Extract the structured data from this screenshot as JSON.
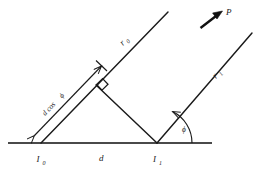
{
  "figure": {
    "background_color": "#ffffff",
    "line_color": "#1a1a1a",
    "text_color": "#1a1a1a",
    "labels": {
      "source_left": "I",
      "source_left_sub": "0",
      "source_right": "I",
      "source_right_sub": "1",
      "ray_left": "r",
      "ray_left_sub": "0",
      "ray_right": "r",
      "ray_right_sub": "1",
      "baseline_separation": "d",
      "path_difference": "d cos",
      "path_difference_symbol": "ϕ",
      "angle": "ϕ",
      "vector": "P"
    },
    "geometry": {
      "baseline_y": 143,
      "baseline_x_start": 8,
      "baseline_x_end": 212,
      "point_I0_x": 41,
      "point_I0_y": 143,
      "point_I1_x": 157,
      "point_I1_y": 143,
      "ray_r0_end_x": 168,
      "ray_r0_end_y": 12,
      "ray_r1_end_x": 252,
      "ray_r1_end_y": 33,
      "foot_x": 96,
      "foot_y": 85,
      "angle_degrees": 48
    }
  }
}
